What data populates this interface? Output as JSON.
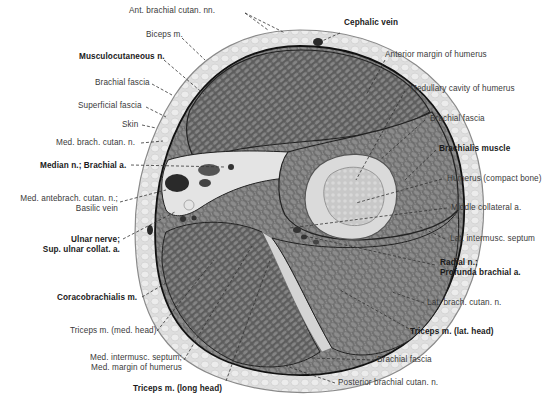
{
  "figure": {
    "background": "#ffffff",
    "colors": {
      "skin": "#d8d8d8",
      "skin_edge": "#8a8a8a",
      "fascia_line": "#111111",
      "muscle_dark": "#5a5a5a",
      "muscle_mid": "#7a7a7a",
      "bone_cortex": "#dcdcdc",
      "marrow": "#c4c4c4",
      "leader_line": "#333333"
    }
  },
  "labels": {
    "left": [
      {
        "id": "musculocutaneous_n",
        "text": "Musculocutaneous n.",
        "bold": true
      },
      {
        "id": "brachial_fascia_left",
        "text": "Brachial fascia",
        "bold": false
      },
      {
        "id": "superficial_fascia",
        "text": "Superficial fascia",
        "bold": false
      },
      {
        "id": "skin",
        "text": "Skin",
        "bold": false
      },
      {
        "id": "med_brach_cutan_n",
        "text": "Med. brach. cutan. n.",
        "bold": false
      },
      {
        "id": "median_n_brachial_a",
        "text": "Median n.; Brachial a.",
        "bold": true
      },
      {
        "id": "med_antebrach_cutan_n",
        "text": "Med. antebrach. cutan. n.;",
        "bold": false
      },
      {
        "id": "basilic_vein",
        "text": "Basilic vein",
        "bold": false
      },
      {
        "id": "ulnar_nerve",
        "text": "Ulnar nerve;",
        "bold": true
      },
      {
        "id": "sup_ulnar_collat_a",
        "text": "Sup. ulnar collat. a.",
        "bold": true
      },
      {
        "id": "coracobrachialis_m",
        "text": "Coracobrachialis m.",
        "bold": true
      }
    ],
    "top": [
      {
        "id": "ant_brachial_cutan_nn",
        "text": "Ant. brachial cutan. nn.",
        "bold": false
      },
      {
        "id": "biceps_m",
        "text": "Biceps m.",
        "bold": false
      },
      {
        "id": "cephalic_vein",
        "text": "Cephalic vein",
        "bold": true
      }
    ],
    "right": [
      {
        "id": "anterior_margin_humerus",
        "text": "Anterior margin of humerus",
        "bold": false
      },
      {
        "id": "medullary_cavity_humerus",
        "text": "Medullary cavity of humerus",
        "bold": false
      },
      {
        "id": "brachial_fascia_right",
        "text": "Brachial fascia",
        "bold": false
      },
      {
        "id": "brachialis_muscle",
        "text": "Brachialis muscle",
        "bold": true
      },
      {
        "id": "humerus_compact_bone",
        "text": "Humerus (compact bone)",
        "bold": false
      },
      {
        "id": "middle_collateral_a",
        "text": "Middle collateral a.",
        "bold": false
      },
      {
        "id": "lat_intermusc_septum",
        "text": "Lat. intermusc. septum",
        "bold": false
      },
      {
        "id": "radial_n",
        "text": "Radial n.;",
        "bold": true
      },
      {
        "id": "profunda_brachial_a",
        "text": "Profunda brachial a.",
        "bold": true
      },
      {
        "id": "lat_brach_cutan_n",
        "text": "Lat. brach. cutan. n.",
        "bold": false
      },
      {
        "id": "triceps_lat_head",
        "text": "Triceps m. (lat. head)",
        "bold": true
      }
    ],
    "bottom": [
      {
        "id": "triceps_med_head",
        "text": "Triceps m. (med. head)",
        "bold": false
      },
      {
        "id": "med_intermusc_septum",
        "text": "Med. intermusc. septum;",
        "bold": false
      },
      {
        "id": "med_margin_humerus",
        "text": "Med. margin of humerus",
        "bold": false
      },
      {
        "id": "triceps_long_head",
        "text": "Triceps m. (long head)",
        "bold": true
      },
      {
        "id": "brachial_fascia_bottom",
        "text": "Brachial fascia",
        "bold": false
      },
      {
        "id": "posterior_brachial_cutan_n",
        "text": "Posterior brachial cutan. n.",
        "bold": false
      }
    ]
  }
}
